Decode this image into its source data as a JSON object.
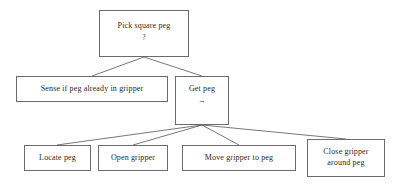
{
  "diagram": {
    "type": "task-decomposition-tree",
    "background_color": "#ffffff",
    "line_color": "#555555",
    "border_color": "#6b6b6b",
    "text_color": "#2a2a2a",
    "nodes": {
      "root": {
        "label": "Pick square peg",
        "sublabel": "?"
      },
      "sense": {
        "label": "Sense if peg already in gripper"
      },
      "get_peg": {
        "label": "Get peg",
        "sublabel": "→"
      },
      "locate_peg": {
        "label": "Locate peg"
      },
      "open_gripper": {
        "label": "Open gripper"
      },
      "move_gripper": {
        "label": "Move gripper to peg"
      },
      "close_gripper": {
        "label": "Close gripper\naround peg"
      }
    }
  }
}
